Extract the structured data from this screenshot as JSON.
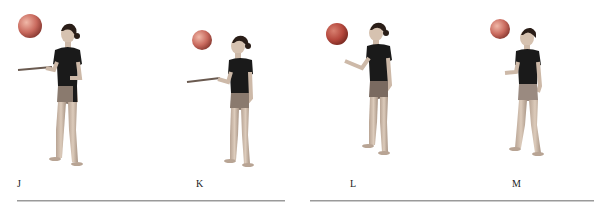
{
  "figure": {
    "panels": [
      {
        "id": "J",
        "label": "J",
        "ball_color": "#c96a5e",
        "ball": {
          "cx": 30,
          "cy": 26,
          "r": 12
        },
        "pose": "ribbon-stick-extended",
        "body_x": 68
      },
      {
        "id": "K",
        "label": "K",
        "ball_color": "#c4766a",
        "ball": {
          "cx": 202,
          "cy": 40,
          "r": 10
        },
        "pose": "ribbon-stick-extended",
        "body_x": 240
      },
      {
        "id": "L",
        "label": "L",
        "ball_color": "#b5483d",
        "ball": {
          "cx": 337,
          "cy": 34,
          "r": 11
        },
        "pose": "open-palm-extended",
        "body_x": 377
      },
      {
        "id": "M",
        "label": "M",
        "ball_color": "#b86356",
        "ball": {
          "cx": 500,
          "cy": 29,
          "r": 10
        },
        "pose": "palm-up-near-body",
        "body_x": 527
      }
    ],
    "rules": [
      {
        "x1": 17,
        "x2": 285
      },
      {
        "x1": 310,
        "x2": 594
      }
    ],
    "colors": {
      "shirt": "#1a1a1a",
      "skin": "#cdb9a8",
      "shorts": "#8a7a6e",
      "rule": "#9a9a9a"
    }
  }
}
